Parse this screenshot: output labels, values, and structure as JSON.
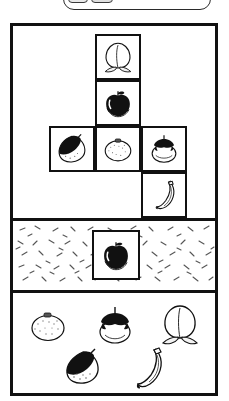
{
  "app": {
    "title": "Fruit Arrangement Puzzle",
    "colors": {
      "ink": "#111111",
      "paper": "#ffffff",
      "fill_black": "#111111",
      "texture_gray": "#555555"
    }
  },
  "top_tray": {
    "name": "tray-widget",
    "note": "partially cut off at top edge of screenshot",
    "chips": [
      {
        "label": ""
      },
      {
        "label": ""
      }
    ]
  },
  "panels": [
    {
      "id": "grid-panel",
      "label": "",
      "kind": "grid",
      "cells": [
        {
          "slot": "top",
          "fruit": "peach",
          "icon": "peach-icon",
          "style": "outline",
          "row": 0,
          "col": 1
        },
        {
          "slot": "upper-middle",
          "fruit": "apple",
          "icon": "apple-icon",
          "style": "filled",
          "row": 1,
          "col": 1
        },
        {
          "slot": "middle-left",
          "fruit": "chestnut",
          "icon": "chestnut-icon",
          "style": "half-filled",
          "row": 2,
          "col": 0
        },
        {
          "slot": "middle-center",
          "fruit": "orange",
          "icon": "orange-icon",
          "style": "outline",
          "row": 2,
          "col": 1
        },
        {
          "slot": "middle-right",
          "fruit": "persimmon",
          "icon": "persimmon-icon",
          "style": "outline",
          "row": 2,
          "col": 2
        },
        {
          "slot": "bottom-right",
          "fruit": "banana",
          "icon": "banana-icon",
          "style": "outline",
          "row": 3,
          "col": 2
        }
      ]
    },
    {
      "id": "texture-panel",
      "label": "",
      "kind": "textured",
      "background": "speckled",
      "cells": [
        {
          "slot": "center",
          "fruit": "apple",
          "icon": "apple-icon",
          "style": "filled"
        }
      ]
    },
    {
      "id": "bank-panel",
      "label": "",
      "kind": "bank",
      "items": [
        {
          "fruit": "orange",
          "icon": "orange-icon",
          "style": "outline",
          "row": 0,
          "col": 0
        },
        {
          "fruit": "persimmon",
          "icon": "persimmon-icon",
          "style": "outline",
          "row": 0,
          "col": 1
        },
        {
          "fruit": "peach",
          "icon": "peach-icon",
          "style": "outline",
          "row": 0,
          "col": 2
        },
        {
          "fruit": "chestnut",
          "icon": "chestnut-icon",
          "style": "half-filled",
          "row": 1,
          "col": 0
        },
        {
          "fruit": "banana",
          "icon": "banana-icon",
          "style": "outline",
          "row": 1,
          "col": 1
        }
      ]
    }
  ]
}
